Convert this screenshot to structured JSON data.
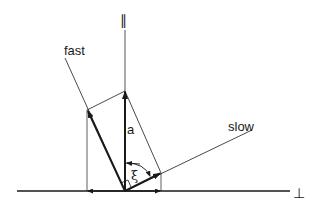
{
  "diagram": {
    "type": "vector-decomposition",
    "labels": {
      "parallel_axis": "∥",
      "perpendicular_axis": "⊥",
      "fast_axis": "fast",
      "slow_axis": "slow",
      "vector": "a",
      "angle": "ξ"
    },
    "colors": {
      "line": "#1a1a1a",
      "background": "#ffffff"
    },
    "geometry": {
      "origin": [
        125,
        191
      ],
      "vector_a_tip": [
        125,
        91
      ],
      "fast_component_tip": [
        87,
        110
      ],
      "slow_component_tip": [
        161,
        173
      ],
      "fast_axis_end": [
        65,
        58
      ],
      "slow_axis_end": [
        252,
        130
      ],
      "horizontal_axis": [
        [
          17,
          191
        ],
        [
          290,
          191
        ]
      ],
      "vertical_axis": [
        [
          125,
          30
        ],
        [
          125,
          191
        ]
      ]
    }
  }
}
